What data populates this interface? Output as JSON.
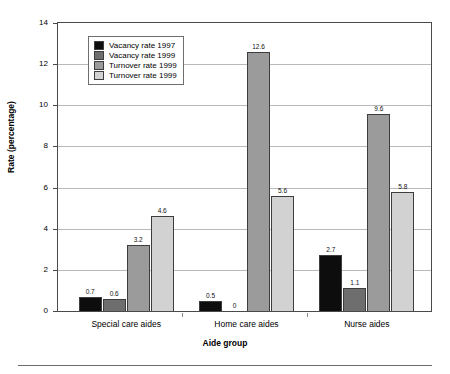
{
  "chart_data": {
    "type": "bar",
    "title": "",
    "xlabel": "Aide group",
    "ylabel": "Rate (percentage)",
    "categories": [
      "Special care aides",
      "Home care aides",
      "Nurse aides"
    ],
    "ylim": [
      0,
      14
    ],
    "yticks": [
      0,
      2,
      4,
      6,
      8,
      10,
      12,
      14
    ],
    "ytick_labels": [
      "0",
      "2",
      "4",
      "6",
      "8",
      "10",
      "12",
      "14"
    ],
    "grid": true,
    "legend_position": "upper left inside",
    "series": [
      {
        "name": "Vacancy rate 1997",
        "color": "#0d0d0d",
        "values": [
          0.7,
          0.5,
          2.7
        ],
        "labels": [
          "0.7",
          "0.5",
          "2.7"
        ]
      },
      {
        "name": "Vacancy rate 1999",
        "color": "#6e6e6e",
        "values": [
          0.6,
          0,
          1.1
        ],
        "labels": [
          "0.6",
          "0",
          "1.1"
        ]
      },
      {
        "name": "Turnover rate 1999",
        "color": "#9b9b9b",
        "values": [
          3.2,
          12.6,
          9.6
        ],
        "labels": [
          "3.2",
          "12.6",
          "9.6"
        ]
      },
      {
        "name": "Turnover rate 1999",
        "color": "#d2d2d2",
        "values": [
          4.6,
          5.6,
          5.8
        ],
        "labels": [
          "4.6",
          "5.6",
          "5.8"
        ]
      }
    ]
  }
}
